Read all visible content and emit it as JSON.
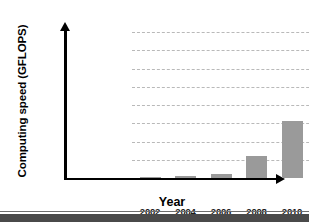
{
  "chart_data": {
    "type": "bar",
    "title": "",
    "xlabel": "Year",
    "ylabel": "Computing speed (GFLOPS)",
    "categories": [
      "2002",
      "2004",
      "2006",
      "2008",
      "2010",
      "2012"
    ],
    "values": [
      500,
      1000,
      2000,
      12000,
      31000,
      74000
    ],
    "series": [
      {
        "name": "Computing speed",
        "values": [
          500,
          1000,
          2000,
          12000,
          31000,
          74000
        ]
      }
    ],
    "ylim": [
      0,
      80000
    ],
    "xlim_note": "categorical",
    "ytick_labels": [
      "0",
      "10,000",
      "20,000",
      "30,000",
      "40,000",
      "50,000",
      "60,000",
      "70,000",
      "80,000"
    ],
    "ytick_values": [
      0,
      10000,
      20000,
      30000,
      40000,
      50000,
      60000,
      70000,
      80000
    ],
    "grid": true,
    "grid_style": "dashed-horizontal",
    "legend": false,
    "legend_position": "none",
    "bar_color": "#9a9a9a",
    "axis_color": "#000000",
    "grid_color": "#b9b9b9",
    "background_color": "#ffffff"
  }
}
